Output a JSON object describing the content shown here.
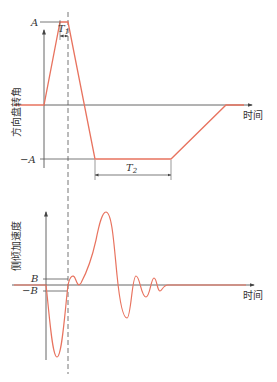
{
  "caption_fragment": "",
  "top_plot": {
    "y_axis_label": "方向盘转角",
    "x_axis_label": "时间",
    "level_pos_label": "A",
    "level_neg_label": "−A",
    "interval_1_label": "T",
    "interval_1_sub": "1",
    "interval_2_label": "T",
    "interval_2_sub": "2"
  },
  "bottom_plot": {
    "y_axis_label": "侧倾加速度",
    "x_axis_label": "时间",
    "threshold_pos_label": "B",
    "threshold_neg_label": "−B"
  },
  "colors": {
    "curve": "#e8735f",
    "axis": "#555555",
    "text": "#333333"
  }
}
